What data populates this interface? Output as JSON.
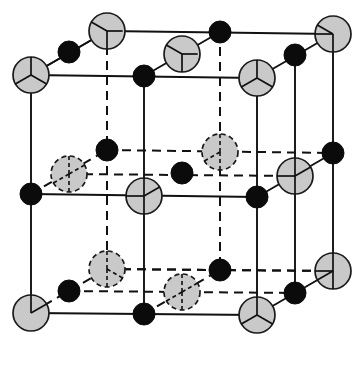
{
  "figure": {
    "kind": "crystal-structure-unit-cell",
    "structure_name": "",
    "caption": "",
    "background_color": "#ffffff",
    "canvas": {
      "width": 361,
      "height": 371
    }
  },
  "geometry": {
    "front_face": {
      "top_left": [
        31,
        75
      ],
      "top_right": [
        257,
        78
      ],
      "bottom_right": [
        257,
        315
      ],
      "bottom_left": [
        31,
        313
      ]
    },
    "depth_offset": [
      76,
      -44
    ],
    "back_face": {
      "top_left": [
        107,
        31
      ],
      "top_right": [
        333,
        34
      ],
      "bottom_right": [
        333,
        271
      ],
      "bottom_left": [
        107,
        269
      ]
    }
  },
  "style": {
    "large_atom_fill": "#c9c9c9",
    "large_atom_stroke": "#1a1a1a",
    "small_atom_fill": "#0b0b0b",
    "edge_color": "#111111",
    "large_atom_radius": 18,
    "small_atom_radius": 11,
    "visible_edge_width": 1.9,
    "hidden_edge_dash": "9 6"
  },
  "legend": {
    "large_atom_label": "",
    "small_atom_label": ""
  },
  "chart_data": {
    "type": "scatter",
    "title": "",
    "xlabel": "",
    "ylabel": "",
    "lattice": {
      "cell_type": "fcc-rocksalt",
      "large_atom_sites": [
        {
          "site": "corner",
          "count": 8
        },
        {
          "site": "face-center",
          "count": 6
        }
      ],
      "small_atom_sites": [
        {
          "site": "edge-midpoint",
          "count": 12
        },
        {
          "site": "body-center",
          "count": 1
        }
      ],
      "total_large_atoms": 14,
      "total_small_atoms": 13
    },
    "large_atoms": [
      {
        "id": "L1",
        "site": "corner",
        "cx": 31,
        "cy": 75,
        "r": 18,
        "hidden": false,
        "ticks": [
          [
            0,
            -1
          ],
          [
            -0.87,
            0.5
          ],
          [
            0.87,
            0.5
          ]
        ]
      },
      {
        "id": "L2",
        "site": "corner",
        "cx": 257,
        "cy": 78,
        "r": 18,
        "hidden": false,
        "ticks": [
          [
            0,
            -1
          ],
          [
            -0.87,
            0.5
          ],
          [
            0.87,
            0.5
          ]
        ]
      },
      {
        "id": "L3",
        "site": "corner",
        "cx": 257,
        "cy": 315,
        "r": 18,
        "hidden": false,
        "ticks": [
          [
            0,
            -1
          ],
          [
            -0.87,
            0.5
          ],
          [
            0.87,
            0.5
          ]
        ]
      },
      {
        "id": "L4",
        "site": "corner",
        "cx": 31,
        "cy": 313,
        "r": 18,
        "hidden": false,
        "ticks": [
          [
            0,
            -1
          ],
          [
            0.87,
            -0.5
          ]
        ]
      },
      {
        "id": "L5",
        "site": "corner",
        "cx": 107,
        "cy": 31,
        "r": 18,
        "hidden": false,
        "ticks": [
          [
            0,
            1
          ],
          [
            -0.87,
            -0.5
          ],
          [
            0.87,
            0
          ]
        ]
      },
      {
        "id": "L6",
        "site": "corner",
        "cx": 333,
        "cy": 34,
        "r": 18,
        "hidden": false,
        "ticks": [
          [
            0,
            1
          ],
          [
            -0.87,
            -0.5
          ],
          [
            -1,
            0
          ]
        ]
      },
      {
        "id": "L7",
        "site": "corner",
        "cx": 333,
        "cy": 271,
        "r": 18,
        "hidden": false,
        "ticks": [
          [
            0,
            -1
          ],
          [
            0,
            1
          ],
          [
            -1,
            0
          ],
          [
            -0.87,
            0.5
          ]
        ]
      },
      {
        "id": "L8",
        "site": "corner",
        "cx": 107,
        "cy": 269,
        "r": 18,
        "hidden": true,
        "ticks": [
          [
            0,
            -1
          ],
          [
            0,
            1
          ],
          [
            0.87,
            0.5
          ]
        ]
      },
      {
        "id": "L9",
        "site": "face-center-front",
        "cx": 144,
        "cy": 196,
        "r": 18,
        "hidden": false,
        "ticks": [
          [
            0,
            -1
          ],
          [
            0,
            1
          ],
          [
            -1,
            0
          ],
          [
            0.87,
            -0.5
          ]
        ]
      },
      {
        "id": "L10",
        "site": "face-center-back",
        "cx": 220,
        "cy": 152,
        "r": 18,
        "hidden": true,
        "ticks": [
          [
            0,
            -1
          ],
          [
            0,
            1
          ],
          [
            -0.87,
            0.5
          ]
        ]
      },
      {
        "id": "L11",
        "site": "face-center-left",
        "cx": 69,
        "cy": 174,
        "r": 18,
        "hidden": true,
        "ticks": [
          [
            0,
            -1
          ],
          [
            0,
            1
          ],
          [
            -0.87,
            0.5
          ],
          [
            0.87,
            -0.5
          ]
        ]
      },
      {
        "id": "L12",
        "site": "face-center-right",
        "cx": 295,
        "cy": 176,
        "r": 18,
        "hidden": false,
        "ticks": [
          [
            0,
            -1
          ],
          [
            0,
            1
          ],
          [
            -1,
            0
          ],
          [
            0.87,
            -0.5
          ]
        ]
      },
      {
        "id": "L13",
        "site": "face-center-top",
        "cx": 182,
        "cy": 54,
        "r": 18,
        "hidden": false,
        "ticks": [
          [
            0,
            1
          ],
          [
            -0.87,
            -0.5
          ],
          [
            0.87,
            0
          ]
        ]
      },
      {
        "id": "L14",
        "site": "face-center-bottom",
        "cx": 182,
        "cy": 292,
        "r": 18,
        "hidden": true,
        "ticks": [
          [
            0,
            -1
          ],
          [
            0,
            1
          ],
          [
            -0.87,
            0.5
          ],
          [
            0.87,
            -0.5
          ]
        ]
      }
    ],
    "small_atoms": [
      {
        "id": "S1",
        "site": "edge-mid-top-front",
        "cx": 144,
        "cy": 76,
        "r": 11,
        "hidden": false
      },
      {
        "id": "S2",
        "site": "edge-mid-top-back",
        "cx": 220,
        "cy": 32,
        "r": 11,
        "hidden": false
      },
      {
        "id": "S3",
        "site": "edge-mid-top-left",
        "cx": 69,
        "cy": 52,
        "r": 11,
        "hidden": false
      },
      {
        "id": "S4",
        "site": "edge-mid-top-right",
        "cx": 295,
        "cy": 55,
        "r": 11,
        "hidden": false
      },
      {
        "id": "S5",
        "site": "edge-mid-bottom-front",
        "cx": 144,
        "cy": 314,
        "r": 11,
        "hidden": false
      },
      {
        "id": "S6",
        "site": "edge-mid-bottom-back",
        "cx": 220,
        "cy": 270,
        "r": 11,
        "hidden": true
      },
      {
        "id": "S7",
        "site": "edge-mid-bottom-left",
        "cx": 69,
        "cy": 291,
        "r": 11,
        "hidden": true
      },
      {
        "id": "S8",
        "site": "edge-mid-bottom-right",
        "cx": 295,
        "cy": 293,
        "r": 11,
        "hidden": false
      },
      {
        "id": "S9",
        "site": "edge-mid-vertical-fl",
        "cx": 31,
        "cy": 194,
        "r": 11,
        "hidden": false
      },
      {
        "id": "S10",
        "site": "edge-mid-vertical-fr",
        "cx": 257,
        "cy": 197,
        "r": 11,
        "hidden": false
      },
      {
        "id": "S11",
        "site": "edge-mid-vertical-bl",
        "cx": 107,
        "cy": 150,
        "r": 11,
        "hidden": true
      },
      {
        "id": "S12",
        "site": "edge-mid-vertical-br",
        "cx": 333,
        "cy": 153,
        "r": 11,
        "hidden": false
      },
      {
        "id": "S13",
        "site": "body-center",
        "cx": 182,
        "cy": 173,
        "r": 11,
        "hidden": true
      }
    ]
  }
}
